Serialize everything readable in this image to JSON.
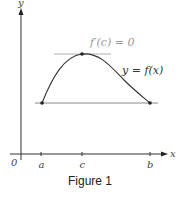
{
  "figure": {
    "caption": "Figure 1",
    "axes": {
      "x_label": "x",
      "y_label": "y",
      "origin_label": "0"
    },
    "ticks": [
      {
        "label": "a",
        "x": 41
      },
      {
        "label": "c",
        "x": 82
      },
      {
        "label": "b",
        "x": 150
      }
    ],
    "annotations": {
      "derivative": "f′(c) = 0",
      "curve": "y = f(x)"
    },
    "colors": {
      "curve": "#333333",
      "axis": "#333333",
      "tangent": "#b0b0b0",
      "secant": "#888888",
      "derivative_text": "#9a9a9a"
    }
  }
}
